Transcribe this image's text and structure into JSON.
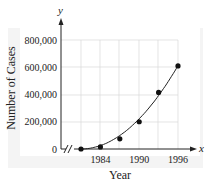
{
  "chart_data": {
    "type": "scatter",
    "title": "",
    "xlabel": "Year",
    "ylabel": "Number of Cases",
    "x_axis_var": "x",
    "y_axis_var": "y",
    "x_ticks": [
      "1984",
      "1990",
      "1996"
    ],
    "y_ticks": [
      "0",
      "200,000",
      "400,000",
      "600,000",
      "800,000"
    ],
    "ylim": [
      0,
      800000
    ],
    "xlim": [
      1980,
      1998
    ],
    "grid": true,
    "axis_break": true,
    "series": [
      {
        "name": "Cases",
        "x": [
          1981,
          1984,
          1987,
          1990,
          1993,
          1996
        ],
        "values": [
          0,
          15000,
          75000,
          200000,
          415000,
          610000
        ]
      }
    ],
    "fit_curve": "quadratic"
  }
}
